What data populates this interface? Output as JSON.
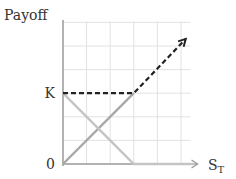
{
  "chart_data": {
    "type": "line",
    "title": "",
    "ylabel": "Payoff",
    "xlabel": "S",
    "xlabel_subscript": "T",
    "y_tick_labels": [
      {
        "value": 0,
        "label": "0"
      },
      {
        "value": 3,
        "label": "K"
      }
    ],
    "xlim": [
      0,
      6
    ],
    "ylim": [
      0,
      6
    ],
    "grid": true,
    "series": [
      {
        "name": "long-stock",
        "style": "solid",
        "color": "#a8a8a8",
        "x": [
          0,
          3
        ],
        "y": [
          0,
          3
        ]
      },
      {
        "name": "short-put",
        "style": "solid",
        "color": "#c4c4c4",
        "x": [
          0,
          3,
          5.6
        ],
        "y": [
          3,
          0,
          0
        ]
      },
      {
        "name": "combined-payoff",
        "style": "dashed",
        "color": "#222222",
        "x": [
          0,
          3,
          5.2
        ],
        "y": [
          3,
          3,
          5.3
        ]
      }
    ],
    "axis_color": "#9a9a9a",
    "grid_color": "#e2e2e2"
  }
}
